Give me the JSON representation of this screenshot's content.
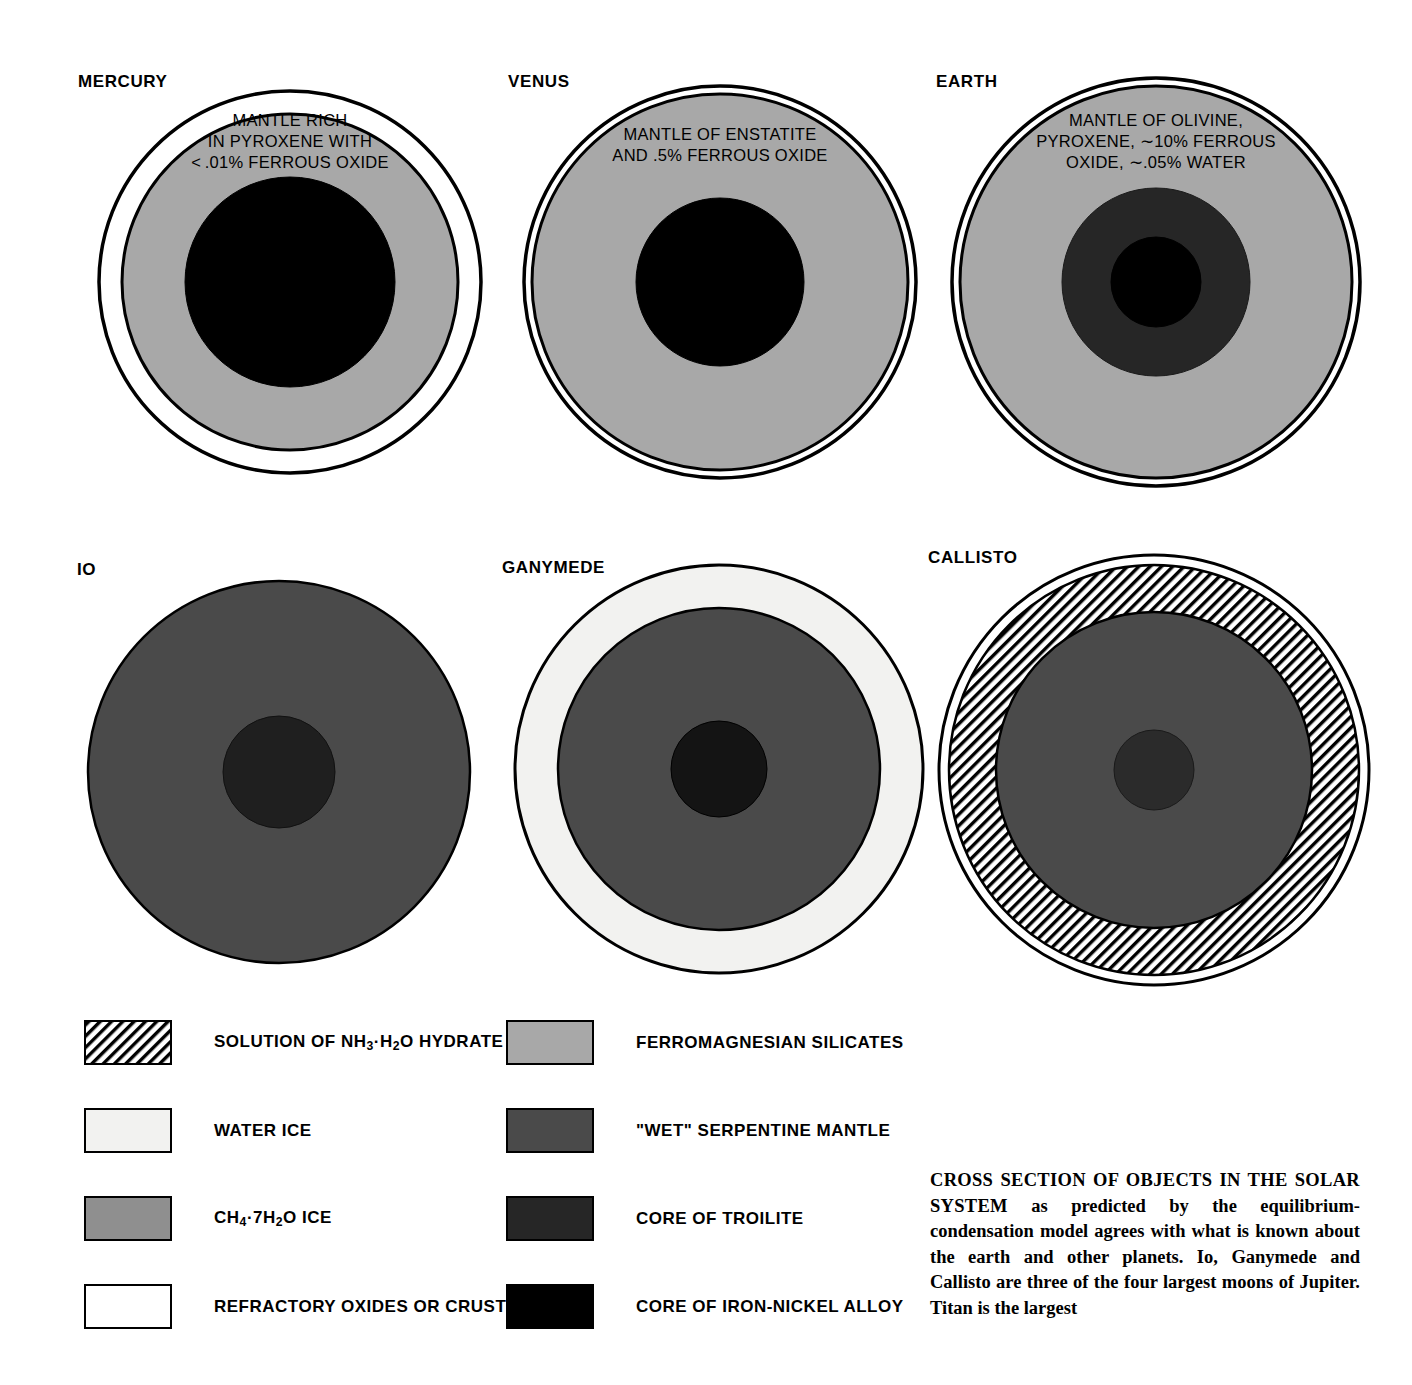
{
  "figure": {
    "title_lead": "CROSS SECTION OF OBJECTS IN THE SOLAR SYSTEM",
    "caption_rest": " as predicted by the equilibrium-condensation model agrees with what is known about the earth and other planets. Io, Ganymede and Callisto are three of the four largest moons of Jupiter. Titan is the largest"
  },
  "colors": {
    "background": "#ffffff",
    "outline": "#000000",
    "refractory_crust": "#ffffff",
    "water_ice": "#f2f2f0",
    "ch4_ice": "#8f8f8f",
    "ferromagnesian_silicates": "#a8a8a8",
    "serpentine_mantle": "#4a4a4a",
    "core_troilite": "#262626",
    "core_iron_nickel": "#000000",
    "nh3_hydrate_hatch": "#000000"
  },
  "bodies": [
    {
      "name": "MERCURY",
      "label": "MERCURY",
      "mantle_text": "MANTLE RICH\nIN PYROXENE WITH\n< .01% FERROUS OXIDE",
      "layers": [
        {
          "material": "refractory_oxides_or_crust",
          "radius_frac": 1.0
        },
        {
          "material": "ferromagnesian_silicates",
          "radius_frac": 0.88
        },
        {
          "material": "core_of_iron_nickel_alloy",
          "radius_frac": 0.55
        }
      ]
    },
    {
      "name": "VENUS",
      "label": "VENUS",
      "mantle_text": "MANTLE OF ENSTATITE\nAND .5% FERROUS OXIDE",
      "layers": [
        {
          "material": "refractory_oxides_or_crust",
          "radius_frac": 1.0
        },
        {
          "material": "ferromagnesian_silicates",
          "radius_frac": 0.965
        },
        {
          "material": "core_of_iron_nickel_alloy",
          "radius_frac": 0.43
        }
      ]
    },
    {
      "name": "EARTH",
      "label": "EARTH",
      "mantle_text": "MANTLE OF OLIVINE,\nPYROXENE, ∼10% FERROUS\nOXIDE, ∼.05% WATER",
      "layers": [
        {
          "material": "refractory_oxides_or_crust",
          "radius_frac": 1.0
        },
        {
          "material": "ferromagnesian_silicates",
          "radius_frac": 0.965
        },
        {
          "material": "core_of_troilite",
          "radius_frac": 0.46
        },
        {
          "material": "core_of_iron_nickel_alloy",
          "radius_frac": 0.22
        }
      ]
    },
    {
      "name": "IO",
      "label": "IO",
      "mantle_text": "",
      "layers": [
        {
          "material": "wet_serpentine_mantle",
          "radius_frac": 1.0
        },
        {
          "material": "core_of_troilite",
          "radius_frac": 0.29
        }
      ]
    },
    {
      "name": "GANYMEDE",
      "label": "GANYMEDE",
      "mantle_text": "",
      "layers": [
        {
          "material": "water_ice",
          "radius_frac": 1.0
        },
        {
          "material": "wet_serpentine_mantle",
          "radius_frac": 0.79
        },
        {
          "material": "core_of_troilite",
          "radius_frac": 0.235
        }
      ]
    },
    {
      "name": "CALLISTO",
      "label": "CALLISTO",
      "mantle_text": "",
      "layers": [
        {
          "material": "refractory_oxides_or_crust",
          "radius_frac": 1.0
        },
        {
          "material": "solution_of_nh3_h2o_hydrate",
          "radius_frac": 0.955
        },
        {
          "material": "wet_serpentine_mantle",
          "radius_frac": 0.735
        },
        {
          "material": "core_of_troilite",
          "radius_frac": 0.185
        }
      ]
    }
  ],
  "legend": {
    "left_column": [
      {
        "key": "nh3_hydrate",
        "label": "SOLUTION OF NH₃·H₂O HYDRATE",
        "pattern": "diagonal-hatch"
      },
      {
        "key": "water_ice",
        "label": "WATER ICE",
        "pattern": "solid"
      },
      {
        "key": "ch4_ice",
        "label": "CH₄·7H₂O  ICE",
        "pattern": "solid"
      },
      {
        "key": "refractory",
        "label": "REFRACTORY OXIDES OR CRUST",
        "pattern": "solid"
      }
    ],
    "right_column": [
      {
        "key": "ferromagnesian",
        "label": "FERROMAGNESIAN  SILICATES",
        "pattern": "solid"
      },
      {
        "key": "serpentine",
        "label": "\"WET\" SERPENTINE MANTLE",
        "pattern": "solid"
      },
      {
        "key": "troilite",
        "label": "CORE OF TROILITE",
        "pattern": "solid"
      },
      {
        "key": "iron_nickel",
        "label": "CORE OF IRON-NICKEL ALLOY",
        "pattern": "solid"
      }
    ]
  }
}
